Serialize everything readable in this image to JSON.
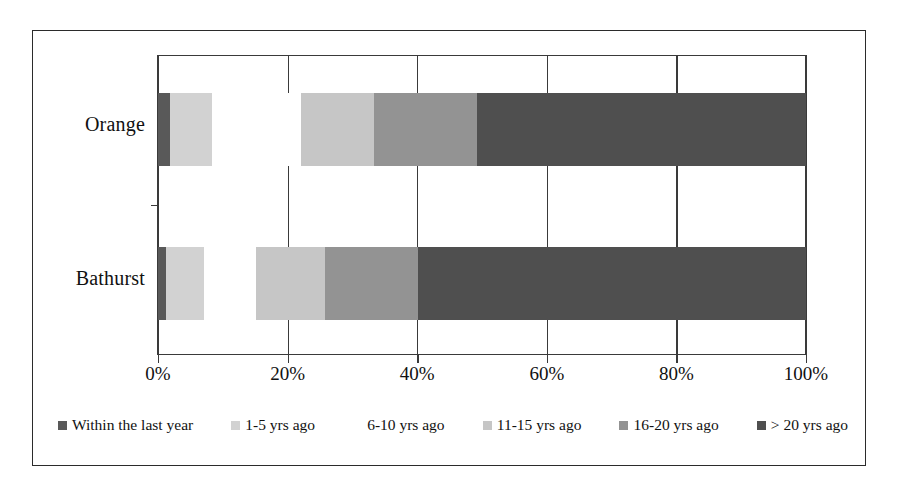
{
  "chart_data": {
    "type": "bar",
    "orientation": "horizontal",
    "stacked": true,
    "stacked_percent": true,
    "title": "",
    "xlabel": "",
    "ylabel": "",
    "xlim": [
      0,
      100
    ],
    "grid": true,
    "legend_position": "bottom",
    "categories": [
      "Orange",
      "Bathurst"
    ],
    "series": [
      {
        "name": "Within the last year",
        "color": "#595959",
        "values": [
          1.8,
          1.3
        ]
      },
      {
        "name": "1-5 yrs ago",
        "color": "#d2d2d2",
        "values": [
          6.6,
          5.8
        ]
      },
      {
        "name": "6-10 yrs ago",
        "color": "#ffffff",
        "values": [
          13.6,
          8.0
        ]
      },
      {
        "name": "11-15 yrs ago",
        "color": "#c6c6c6",
        "values": [
          11.4,
          10.6
        ]
      },
      {
        "name": "16-20 yrs ago",
        "color": "#939393",
        "values": [
          15.9,
          14.4
        ]
      },
      {
        "name": "> 20 yrs ago",
        "color": "#4f4f4f",
        "values": [
          50.7,
          59.9
        ]
      }
    ],
    "xticks": [
      0,
      20,
      40,
      60,
      80,
      100
    ],
    "xticklabels": [
      "0%",
      "20%",
      "40%",
      "60%",
      "80%",
      "100%"
    ]
  },
  "axis": {
    "y_labels": [
      "Orange",
      "Bathurst"
    ],
    "x_labels": [
      "0%",
      "20%",
      "40%",
      "60%",
      "80%",
      "100%"
    ]
  },
  "legend": {
    "items": [
      {
        "label": "Within the last year",
        "color": "#595959"
      },
      {
        "label": "1-5 yrs ago",
        "color": "#d2d2d2"
      },
      {
        "label": "6-10 yrs ago",
        "color": "#ffffff"
      },
      {
        "label": "11-15 yrs ago",
        "color": "#c6c6c6"
      },
      {
        "label": "16-20 yrs ago",
        "color": "#939393"
      },
      {
        "label": "> 20 yrs ago",
        "color": "#4f4f4f"
      }
    ]
  },
  "colors": {
    "frame": "#2b2b2b",
    "axis": "#3a3a3a",
    "background": "#ffffff",
    "text": "#111111"
  }
}
